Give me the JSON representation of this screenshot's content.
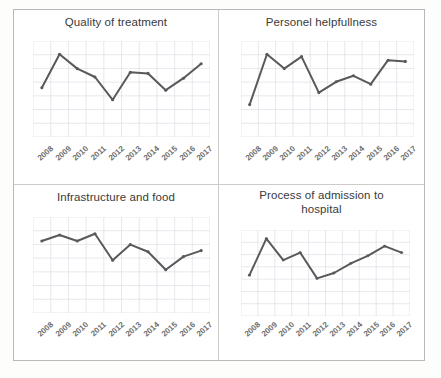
{
  "figure": {
    "panel_layout": "2x2",
    "line_color": "#595959",
    "marker_color": "#595959",
    "grid_color": "#d9d9e3",
    "axis_label_color": "#6d6d6d",
    "title_color": "#3a3a3a"
  },
  "chart_data": [
    {
      "type": "line",
      "title": "Quality of treatment",
      "xlabel": "",
      "ylabel": "",
      "categories": [
        "2008",
        "2009",
        "2010",
        "2011",
        "2012",
        "2013",
        "2014",
        "2015",
        "2016",
        "2017"
      ],
      "values": [
        3.05,
        4.45,
        3.85,
        3.5,
        2.55,
        3.7,
        3.65,
        2.95,
        3.45,
        4.05
      ],
      "ylim": [
        1,
        5
      ],
      "grid": true,
      "legend": "none",
      "markers": true
    },
    {
      "type": "line",
      "title": "Personel helpfullness",
      "xlabel": "",
      "ylabel": "",
      "categories": [
        "2008",
        "2009",
        "2010",
        "2011",
        "2012",
        "2013",
        "2014",
        "2015",
        "2016",
        "2017"
      ],
      "values": [
        2.35,
        4.45,
        3.85,
        4.35,
        2.85,
        3.3,
        3.55,
        3.2,
        4.2,
        4.15
      ],
      "ylim": [
        1,
        5
      ],
      "grid": true,
      "legend": "none",
      "markers": true
    },
    {
      "type": "line",
      "title": "Infrastructure and food",
      "xlabel": "",
      "ylabel": "",
      "categories": [
        "2008",
        "2009",
        "2010",
        "2011",
        "2012",
        "2013",
        "2014",
        "2015",
        "2016",
        "2017"
      ],
      "values": [
        4.0,
        4.25,
        4.0,
        4.3,
        3.2,
        3.85,
        3.55,
        2.8,
        3.35,
        3.6
      ],
      "ylim": [
        1,
        5
      ],
      "grid": true,
      "legend": "none",
      "markers": true
    },
    {
      "type": "line",
      "title": "Process of admission to hospital",
      "xlabel": "",
      "ylabel": "",
      "categories": [
        "2008",
        "2009",
        "2010",
        "2011",
        "2012",
        "2013",
        "2014",
        "2015",
        "2016",
        "2017"
      ],
      "values": [
        2.9,
        4.6,
        3.6,
        3.95,
        2.75,
        3.0,
        3.45,
        3.8,
        4.25,
        3.95
      ],
      "ylim": [
        1,
        5
      ],
      "grid": true,
      "legend": "none",
      "markers": true
    }
  ],
  "panels": [
    {
      "title": "Quality of treatment",
      "title_lines": [
        "Quality of treatment"
      ],
      "ticks": [
        "2008",
        "2009",
        "2010",
        "2011",
        "2012",
        "2013",
        "2014",
        "2015",
        "2016",
        "2017"
      ]
    },
    {
      "title": "Personel helpfullness",
      "title_lines": [
        "Personel helpfullness"
      ],
      "ticks": [
        "2008",
        "2009",
        "2010",
        "2011",
        "2012",
        "2013",
        "2014",
        "2015",
        "2016",
        "2017"
      ]
    },
    {
      "title": "Infrastructure and food",
      "title_lines": [
        "Infrastructure and food"
      ],
      "ticks": [
        "2008",
        "2009",
        "2010",
        "2011",
        "2012",
        "2013",
        "2014",
        "2015",
        "2016",
        "2017"
      ]
    },
    {
      "title": "Process of admission to hospital",
      "title_lines": [
        "Process of admission to",
        "hospital"
      ],
      "ticks": [
        "2008",
        "2009",
        "2010",
        "2011",
        "2012",
        "2013",
        "2014",
        "2015",
        "2016",
        "2017"
      ]
    }
  ]
}
